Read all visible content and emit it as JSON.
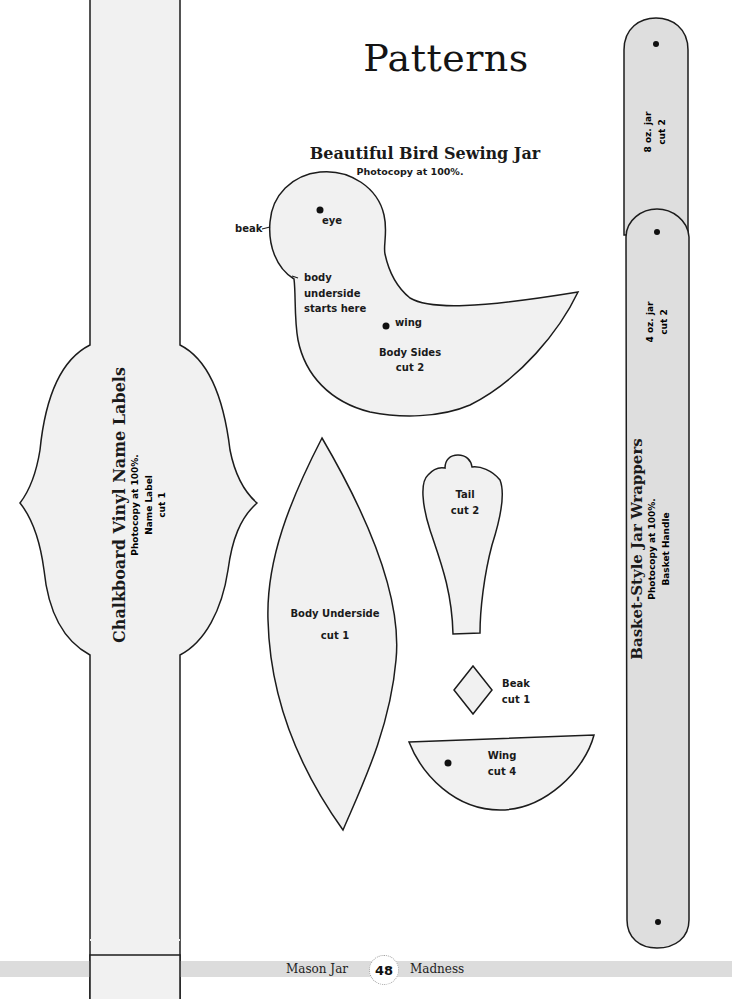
{
  "page": {
    "title": "Patterns",
    "footer": {
      "left": "Mason Jar",
      "page_number": "48",
      "right": "Madness"
    }
  },
  "colors": {
    "fill_light": "#f1f1f1",
    "fill_gray": "#dedede",
    "outline": "#1c1c1c",
    "footer_band": "#dcdcdc"
  },
  "bird_pattern": {
    "heading": "Beautiful Bird Sewing Jar",
    "instruction": "Photocopy at 100%.",
    "body_sides": {
      "annotations": {
        "beak": "beak",
        "eye": "eye",
        "body_underside_1": "body",
        "body_underside_2": "underside",
        "body_underside_3": "starts here",
        "wing": "wing"
      },
      "name": "Body Sides",
      "cut": "cut 2"
    },
    "body_underside": {
      "name": "Body Underside",
      "cut": "cut 1"
    },
    "tail": {
      "name": "Tail",
      "cut": "cut 2"
    },
    "beak": {
      "name": "Beak",
      "cut": "cut 1"
    },
    "wing": {
      "name": "Wing",
      "cut": "cut 4"
    }
  },
  "chalkboard_pattern": {
    "heading": "Chalkboard Vinyl Name Labels",
    "instruction": "Photocopy at 100%.",
    "piece_name": "Name Label",
    "cut": "cut 1"
  },
  "basket_pattern": {
    "heading": "Basket-Style Jar Wrappers",
    "instruction": "Photocopy at 100%.",
    "piece_name": "Basket Handle",
    "strip_8oz": {
      "name": "8 oz. jar",
      "cut": "cut 2"
    },
    "strip_4oz": {
      "name": "4 oz. jar",
      "cut": "cut 2"
    }
  }
}
